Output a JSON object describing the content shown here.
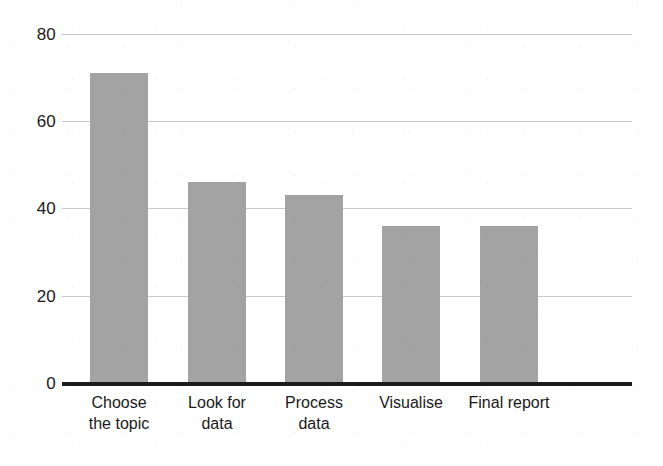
{
  "chart_data": {
    "type": "bar",
    "title": "",
    "subtitle": "",
    "xlabel": "",
    "ylabel": "",
    "categories": [
      "Choose the topic",
      "Look for data",
      "Process data",
      "Visualise",
      "Final report"
    ],
    "category_lines": [
      [
        "Choose",
        "the topic"
      ],
      [
        "Look for",
        "data"
      ],
      [
        "Process",
        "data"
      ],
      [
        "Visualise",
        ""
      ],
      [
        "Final report",
        ""
      ]
    ],
    "values": [
      71,
      46,
      43,
      36,
      36
    ],
    "ylim": [
      0,
      80
    ],
    "yticks": [
      0,
      20,
      40,
      60,
      80
    ],
    "ytick_labels": [
      "0",
      "20",
      "40",
      "60",
      "80"
    ],
    "grid": true,
    "grid_axis": "y",
    "legend": null,
    "legend_position": "none",
    "series": [
      {
        "name": "Time spent",
        "values": [
          71,
          46,
          43,
          36,
          36
        ]
      }
    ],
    "colors": {
      "bar_fill": "#a3a3a3",
      "gridline": "#c9c9c9",
      "axis_line": "#1c1c1c",
      "text": "#1a1a1a",
      "background": "#ffffff"
    }
  }
}
